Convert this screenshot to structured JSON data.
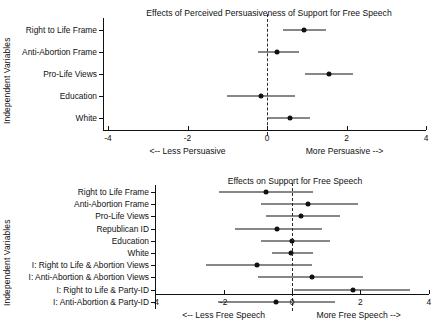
{
  "chart_data": [
    {
      "type": "scatter",
      "plot_style": "coefficient-plot-with-error-bars",
      "title": "Effects of Perceived Persuasiveness of Support for Free Speech",
      "ylabel": "Independent Variables",
      "xlabel": "",
      "xlim": [
        -4,
        4
      ],
      "xticks": [
        -4,
        -2,
        0,
        2,
        4
      ],
      "xtick_labels": [
        "-4",
        "-2",
        "0",
        "2",
        "4"
      ],
      "grid": false,
      "reference_line": 0,
      "reference_line_style": "dashed",
      "left_direction_label": "<-- Less Persuasive",
      "right_direction_label": "More Persuasive -->",
      "categories": [
        "Right to Life Frame",
        "Anti-Abortion Frame",
        "Pro-Life Views",
        "Education",
        "White"
      ],
      "estimates": [
        0.93,
        0.25,
        1.56,
        -0.15,
        0.58
      ],
      "ci_low": [
        0.4,
        -0.23,
        0.96,
        -1.01,
        0.02
      ],
      "ci_high": [
        1.48,
        0.8,
        2.16,
        0.7,
        1.08
      ]
    },
    {
      "type": "scatter",
      "plot_style": "coefficient-plot-with-error-bars",
      "title": "Effects on Support for Free Speech",
      "ylabel": "Independent Variables",
      "xlabel": "",
      "xlim": [
        -4,
        4
      ],
      "xticks": [
        -4,
        -2,
        0,
        2,
        4
      ],
      "xtick_labels": [
        "-4",
        "-2",
        "0",
        "2",
        "4"
      ],
      "grid": false,
      "reference_line": 0,
      "reference_line_style": "dashed",
      "left_direction_label": "<-- Less Free Speech",
      "right_direction_label": "More Free Speech -->",
      "categories": [
        "Right to Life Frame",
        "Anti-Abortion Frame",
        "Pro-Life Views",
        "Republican ID",
        "Education",
        "White",
        "I: Right to Life & Abortion Views",
        "I: Anti-Abortion & Abortion Views",
        "I: Right to Life & Party-ID",
        "I: Anti-Abortion & Party-ID"
      ],
      "estimates": [
        -0.76,
        0.47,
        0.26,
        -0.44,
        0.0,
        -0.03,
        -1.02,
        0.58,
        1.78,
        -0.47
      ],
      "ci_low": [
        -2.13,
        -0.91,
        -0.76,
        -1.67,
        -0.91,
        -0.58,
        -2.51,
        -0.99,
        0.06,
        -2.16
      ],
      "ci_high": [
        0.61,
        1.93,
        1.4,
        0.88,
        1.11,
        0.61,
        0.58,
        2.08,
        3.45,
        1.26
      ]
    }
  ],
  "figure": {
    "background_color": "#ffffff",
    "marker_color": "#111111",
    "line_color": "#111111"
  }
}
